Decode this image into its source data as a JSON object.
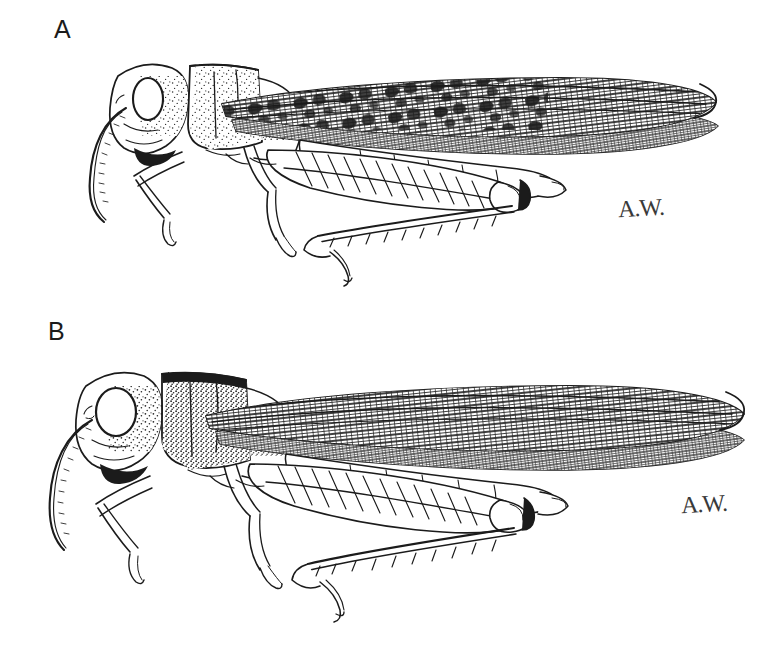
{
  "plate": {
    "background_color": "#ffffff",
    "ink_color": "#1b1b1b",
    "medium": "pen-and-ink stipple line drawing",
    "subject": "lateral view of two grasshopper (locust) specimens",
    "width": 776,
    "height": 651,
    "panel_count": 2
  },
  "panels": [
    {
      "id": "a",
      "label": "A",
      "label_position": {
        "x": 54,
        "y": 17
      },
      "signature": "A.W.",
      "signature_position": {
        "x": 618,
        "y": 196
      },
      "orientation": "lateral, facing left",
      "features": {
        "tegmen_pattern": "dark mottled blotches over reticulate venation",
        "pronotum_texture": "light stipple",
        "eye_shape": "oval, narrow",
        "antenna": "filiform, segmented, curving down and forward",
        "hind_femur_pattern": "herringbone chevrons",
        "hind_tibia": "row of spines with terminal tarsus",
        "abdomen": "segmented with terminal cerci"
      }
    },
    {
      "id": "b",
      "label": "B",
      "label_position": {
        "x": 48,
        "y": 319
      },
      "signature": "A.W.",
      "signature_position": {
        "x": 681,
        "y": 492
      },
      "orientation": "lateral, facing left",
      "features": {
        "tegmen_pattern": "uniform reticulate venation, no dark blotches",
        "pronotum_texture": "heavy stipple with dark dorsal margin",
        "eye_shape": "large and rounded",
        "antenna": "filiform, segmented, curving down and forward",
        "hind_femur_pattern": "herringbone chevrons",
        "hind_tibia": "row of spines with terminal tarsus",
        "abdomen": "segmented with terminal cerci"
      }
    }
  ]
}
